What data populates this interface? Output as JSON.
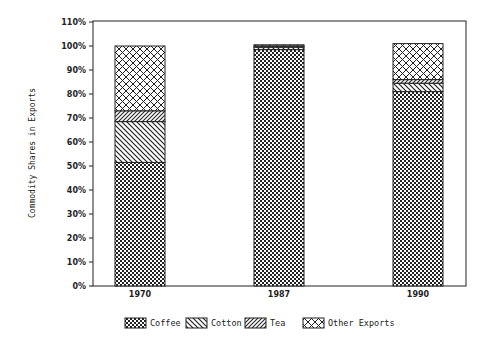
{
  "chart_data": {
    "type": "bar",
    "stacked": true,
    "title": "",
    "xlabel": "",
    "ylabel": "Commodity Shares in Exports",
    "ylim": [
      0,
      110
    ],
    "yticks": [
      "0%",
      "10%",
      "20%",
      "30%",
      "40%",
      "50%",
      "60%",
      "70%",
      "80%",
      "90%",
      "100%",
      "110%"
    ],
    "categories": [
      "1970",
      "1987",
      "1990"
    ],
    "series": [
      {
        "name": "Coffee",
        "pattern": "checker",
        "values": [
          51.5,
          98.5,
          81
        ]
      },
      {
        "name": "Cotton",
        "pattern": "diag-back",
        "values": [
          17,
          1,
          3.5
        ]
      },
      {
        "name": "Tea",
        "pattern": "diag-forward",
        "values": [
          4.5,
          0.5,
          1.5
        ]
      },
      {
        "name": "Other Exports",
        "pattern": "crosshatch",
        "values": [
          27,
          0.5,
          15
        ]
      }
    ],
    "grid": false,
    "legend_position": "bottom",
    "colors": {
      "ink": "#222222",
      "background": "#ffffff"
    }
  }
}
